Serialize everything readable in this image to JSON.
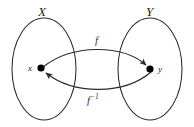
{
  "diagram": {
    "type": "function-inverse-mapping",
    "stroke_color": "#2b2b2b",
    "fill_color": "#ffffff",
    "point_color": "#000000",
    "sets": [
      {
        "id": "domain",
        "label": "X",
        "shape": "ellipse",
        "cx": 44,
        "cy": 69,
        "rx": 32,
        "ry": 51
      },
      {
        "id": "codomain",
        "label": "Y",
        "shape": "ellipse",
        "cx": 150,
        "cy": 69,
        "rx": 32,
        "ry": 51
      }
    ],
    "points": [
      {
        "id": "point-x",
        "label": "x",
        "cx": 41,
        "cy": 68,
        "r": 3.6,
        "in_set": "domain"
      },
      {
        "id": "point-y",
        "label": "y",
        "cx": 150,
        "cy": 69,
        "r": 3.6,
        "in_set": "codomain"
      }
    ],
    "arrows": [
      {
        "id": "arrow-f",
        "label": "f",
        "label_superscript": "",
        "from": "point-x",
        "to": "point-y",
        "direction": "left-to-right",
        "curve": "arc-above"
      },
      {
        "id": "arrow-f-inverse",
        "label": "f",
        "label_superscript": "−1",
        "from": "point-y",
        "to": "point-x",
        "direction": "right-to-left",
        "curve": "arc-below"
      }
    ]
  }
}
